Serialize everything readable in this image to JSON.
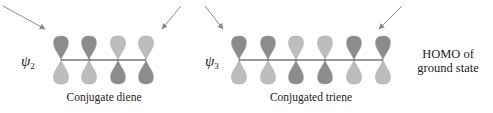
{
  "colors": {
    "dark_lobe": "#8c8c8c",
    "light_lobe": "#bdbdbd",
    "bond": "#333333",
    "arrow": "#8a8a8a",
    "text": "#222222"
  },
  "diene": {
    "psi_symbol": "ψ",
    "psi_subscript": "2",
    "caption": "Conjugate diene",
    "bond_y": 60,
    "orbitals": [
      {
        "x": 61,
        "top": "dark",
        "bottom": "light"
      },
      {
        "x": 89,
        "top": "dark",
        "bottom": "light"
      },
      {
        "x": 118,
        "top": "light",
        "bottom": "dark"
      },
      {
        "x": 146,
        "top": "light",
        "bottom": "dark"
      }
    ]
  },
  "triene": {
    "psi_symbol": "ψ",
    "psi_subscript": "3",
    "caption": "Conjugated triene",
    "bond_y": 60,
    "orbitals": [
      {
        "x": 239,
        "top": "dark",
        "bottom": "light"
      },
      {
        "x": 268,
        "top": "dark",
        "bottom": "light"
      },
      {
        "x": 296,
        "top": "light",
        "bottom": "dark"
      },
      {
        "x": 325,
        "top": "light",
        "bottom": "dark"
      },
      {
        "x": 354,
        "top": "dark",
        "bottom": "light"
      },
      {
        "x": 383,
        "top": "dark",
        "bottom": "light"
      }
    ]
  },
  "side_label": {
    "line1": "HOMO of",
    "line2": "ground state"
  },
  "arrows": [
    {
      "x1": 3,
      "y1": 6,
      "x2": 45,
      "y2": 29
    },
    {
      "x1": 181,
      "y1": 6,
      "x2": 162,
      "y2": 29
    },
    {
      "x1": 205,
      "y1": 6,
      "x2": 223,
      "y2": 29
    },
    {
      "x1": 402,
      "y1": 6,
      "x2": 379,
      "y2": 29
    }
  ]
}
